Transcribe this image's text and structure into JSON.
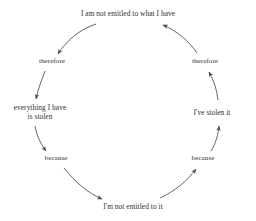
{
  "diagram": {
    "type": "circular-argument-loop",
    "background_color": "#ffffff",
    "text_color": "#2e2e2e",
    "arrow_color": "#4a4a4a",
    "nodes": [
      {
        "id": "top",
        "role": "premise",
        "lines": [
          "I am not entitled to what I have"
        ],
        "x": 128,
        "y": 14
      },
      {
        "id": "therefore-left",
        "role": "connector",
        "lines": [
          "therefore"
        ],
        "x": 52,
        "y": 62
      },
      {
        "id": "everything-stolen",
        "role": "claim",
        "lines": [
          "everything I have",
          "is stolen"
        ],
        "x": 40,
        "y": 112
      },
      {
        "id": "because-left",
        "role": "connector",
        "lines": [
          "because"
        ],
        "x": 56,
        "y": 159
      },
      {
        "id": "bottom",
        "role": "claim",
        "lines": [
          "I'm not entitled to it"
        ],
        "x": 133,
        "y": 207
      },
      {
        "id": "because-right",
        "role": "connector",
        "lines": [
          "because"
        ],
        "x": 203,
        "y": 159
      },
      {
        "id": "stolen-it",
        "role": "claim",
        "lines": [
          "I've stolen it"
        ],
        "x": 212,
        "y": 113
      },
      {
        "id": "therefore-right",
        "role": "connector",
        "lines": [
          "therefore"
        ],
        "x": 205,
        "y": 62
      }
    ],
    "edges": [
      {
        "id": "top-to-therefore-left",
        "from": "top",
        "to": "therefore-left",
        "direction": "down-left"
      },
      {
        "id": "therefore-left-to-everything",
        "from": "therefore-left",
        "to": "everything-stolen",
        "direction": "down"
      },
      {
        "id": "everything-to-because-left",
        "from": "everything-stolen",
        "to": "because-left",
        "direction": "down"
      },
      {
        "id": "because-left-to-bottom",
        "from": "because-left",
        "to": "bottom",
        "direction": "down-right"
      },
      {
        "id": "bottom-to-because-right",
        "from": "bottom",
        "to": "because-right",
        "direction": "up-right"
      },
      {
        "id": "because-right-to-stolen",
        "from": "because-right",
        "to": "stolen-it",
        "direction": "up"
      },
      {
        "id": "stolen-to-therefore-right",
        "from": "stolen-it",
        "to": "therefore-right",
        "direction": "up"
      },
      {
        "id": "therefore-right-to-top",
        "from": "therefore-right",
        "to": "top",
        "direction": "up-left"
      }
    ]
  }
}
